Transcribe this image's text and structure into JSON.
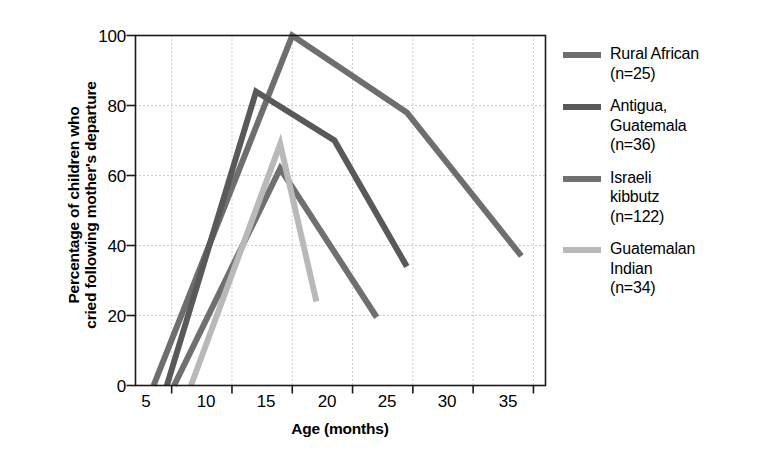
{
  "chart_data": {
    "type": "line",
    "title": "",
    "xlabel": "Age (months)",
    "ylabel": "Percentage of children who cried following mother's departure",
    "ylabel_lines": [
      "Percentage of children who",
      "cried following mother's departure"
    ],
    "xlim": [
      2,
      36
    ],
    "ylim": [
      0,
      100
    ],
    "xticks": [
      5,
      10,
      15,
      20,
      25,
      30,
      35
    ],
    "yticks": [
      0,
      20,
      40,
      60,
      80,
      100
    ],
    "grid": "dotted both axes",
    "legend_position": "right outside",
    "series": [
      {
        "name": "Rural African",
        "legend_label": "Rural African\n(n=25)",
        "n": 25,
        "color": "#6e6e6e",
        "points": [
          [
            3.5,
            0
          ],
          [
            15,
            100
          ],
          [
            24.5,
            78
          ],
          [
            34,
            37
          ]
        ]
      },
      {
        "name": "Antigua, Guatemala",
        "legend_label": "Antigua,\nGuatemala\n(n=36)",
        "n": 36,
        "color": "#595959",
        "points": [
          [
            4.6,
            0
          ],
          [
            12,
            84
          ],
          [
            18.5,
            70
          ],
          [
            24.5,
            34
          ]
        ]
      },
      {
        "name": "Israeli kibbutz",
        "legend_label": "Israeli\nkibbutz\n(n=122)",
        "n": 122,
        "color": "#707070",
        "points": [
          [
            5.2,
            0
          ],
          [
            14,
            62
          ],
          [
            22,
            19.5
          ]
        ]
      },
      {
        "name": "Guatemalan Indian",
        "legend_label": "Guatemalan\nIndian\n(n=34)",
        "n": 34,
        "color": "#b9b9b9",
        "points": [
          [
            6.6,
            0
          ],
          [
            14,
            69
          ],
          [
            17,
            24
          ]
        ]
      }
    ]
  },
  "axes": {
    "frame_color": "#1a1a1a",
    "grid_color": "#9a9a9a"
  }
}
